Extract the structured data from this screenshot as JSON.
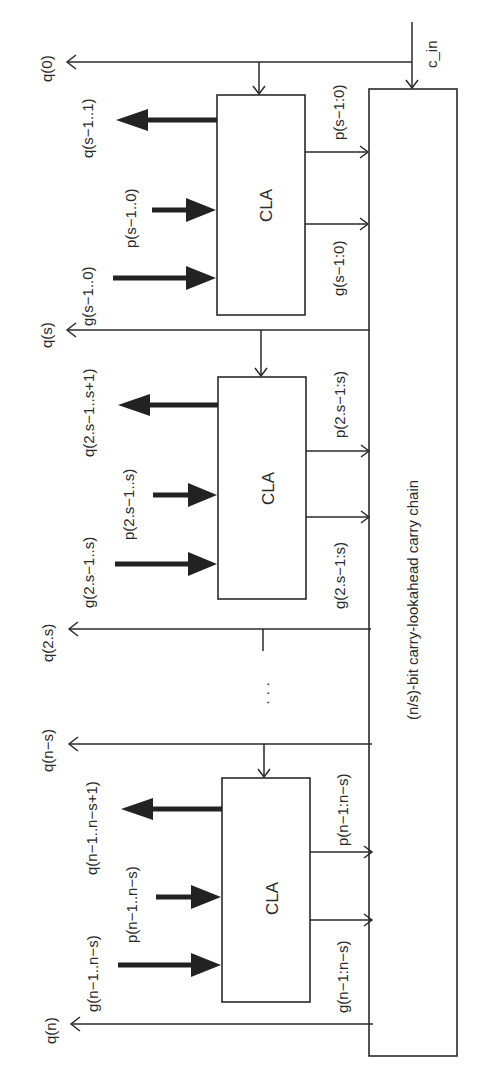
{
  "diagram": {
    "type": "block-diagram",
    "orientation": "rotated-90-ccw",
    "carry_in_label": "c_in",
    "chain": {
      "label": "(n/s)-bit carry-lookahead carry chain"
    },
    "ellipsis": "· · ·",
    "blocks": [
      {
        "label": "CLA",
        "inputs": {
          "g": "g(s−1..0)",
          "p": "p(s−1..0)"
        },
        "output_bus": "q(s−1..1)",
        "carry_in": "q(0)",
        "to_chain": {
          "g": "g(s−1:0)",
          "p": "p(s−1:0)"
        }
      },
      {
        "label": "CLA",
        "inputs": {
          "g": "g(2.s−1..s)",
          "p": "p(2.s−1..s)"
        },
        "output_bus": "q(2.s−1..s+1)",
        "carry_in": "q(s)",
        "to_chain": {
          "g": "g(2.s−1:s)",
          "p": "p(2.s−1:s)"
        }
      },
      {
        "label": "CLA",
        "inputs": {
          "g": "g(n−1..n−s)",
          "p": "p(n−1..n−s)"
        },
        "output_bus": "q(n−1..n−s+1)",
        "carry_in": "q(n−s)",
        "to_chain": {
          "g": "g(n−1:n−s)",
          "p": "p(n−1:n−s)"
        }
      }
    ],
    "carry_outputs": [
      "q(0)",
      "q(s)",
      "q(2.s)",
      "q(n−s)",
      "q(n)"
    ]
  }
}
